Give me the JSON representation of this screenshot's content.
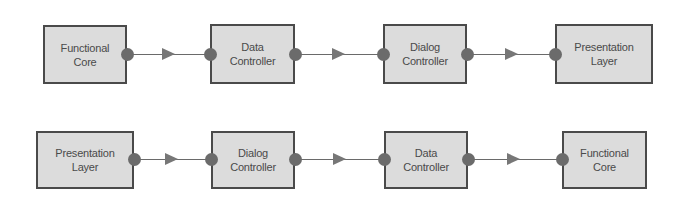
{
  "diagram": {
    "colors": {
      "box_fill": "#dcdcdc",
      "box_border": "#4a4a4a",
      "text": "#4a4a4a",
      "port": "#6b6b6b",
      "wire": "#6a6a6a",
      "arrowhead": "#777777"
    },
    "rows": [
      {
        "name": "top-flow",
        "boxes": [
          {
            "label": "Functional\nCore"
          },
          {
            "label": "Data\nController"
          },
          {
            "label": "Dialog\nController"
          },
          {
            "label": "Presentation\nLayer"
          }
        ]
      },
      {
        "name": "bottom-flow",
        "boxes": [
          {
            "label": "Presentation\nLayer"
          },
          {
            "label": "Dialog\nController"
          },
          {
            "label": "Data\nController"
          },
          {
            "label": "Functional\nCore"
          }
        ]
      }
    ]
  }
}
